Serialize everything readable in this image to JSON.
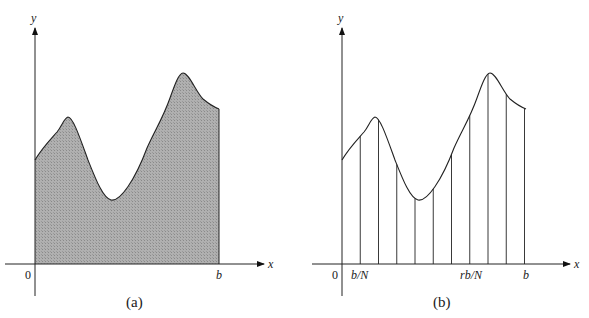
{
  "panels": [
    {
      "id": "a",
      "caption": "(a)",
      "y_label": "y",
      "x_label": "x",
      "origin_label": "0",
      "end_label": "b",
      "fill_color": "#a9a9a9",
      "description": "Area under curve f(x) from 0 to b shaded"
    },
    {
      "id": "b",
      "caption": "(b)",
      "y_label": "y",
      "x_label": "x",
      "origin_label": "0",
      "tick_labels": [
        "b/N",
        "rb/N",
        "b"
      ],
      "strip_count": 10,
      "description": "Interval [0,b] divided into N vertical strips under the curve"
    }
  ]
}
